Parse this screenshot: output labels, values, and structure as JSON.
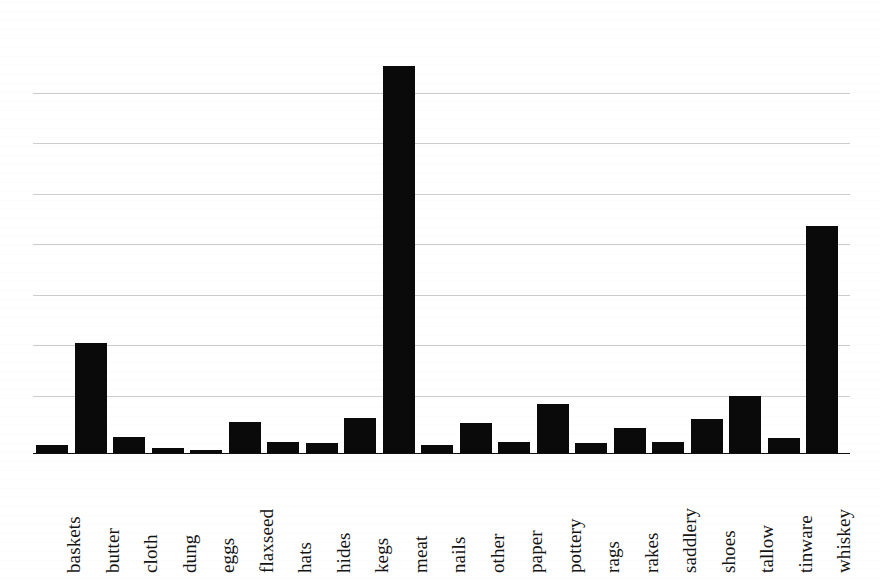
{
  "chart_data": {
    "type": "bar",
    "title": "",
    "subtitle": "",
    "xlabel": "",
    "ylabel": "",
    "categories": [
      "baskets",
      "butter",
      "cloth",
      "dung",
      "eggs",
      "flaxseed",
      "hats",
      "hides",
      "kegs",
      "meat",
      "nails",
      "other",
      "paper",
      "pottery",
      "rags",
      "rakes",
      "saddlery",
      "shoes",
      "tallow",
      "tinware",
      "whiskey"
    ],
    "values": [
      0.14,
      1.96,
      0.28,
      0.09,
      0.05,
      0.56,
      0.19,
      0.18,
      0.63,
      6.9,
      0.14,
      0.54,
      0.19,
      0.88,
      0.18,
      0.44,
      0.19,
      0.61,
      1.02,
      0.26,
      4.04
    ],
    "ylim": [
      0,
      7.0
    ],
    "gridlines": [
      1.0,
      1.9,
      2.8,
      3.7,
      4.6,
      5.5,
      6.4
    ],
    "grid": true,
    "tick_labels_x": [
      "baskets",
      "butter",
      "cloth",
      "dung",
      "eggs",
      "flaxseed",
      "hats",
      "hides",
      "kegs",
      "meat",
      "nails",
      "other",
      "paper",
      "pottery",
      "rags",
      "rakes",
      "saddlery",
      "shoes",
      "tallow",
      "tinware",
      "whiskey"
    ],
    "tick_labels_y": [],
    "legend": [],
    "legend_position": "none",
    "annotations": [],
    "bar_color": "#0a0a0a",
    "grid_color": "#bbbbbb",
    "axis_color": "#111111",
    "background_color": "#ffffff",
    "x_tick_label_rotation": 90
  },
  "figure": {
    "plot_left_px": 33,
    "plot_right_px": 850,
    "baseline_y_px": 453,
    "bar_pitch_px": 38.5,
    "bar_width_px": 32
  }
}
